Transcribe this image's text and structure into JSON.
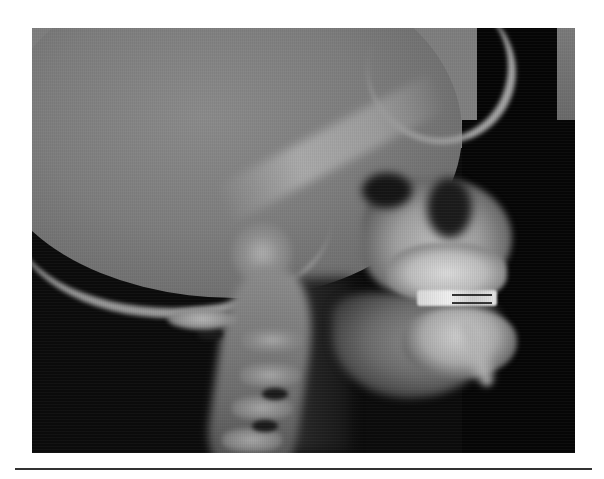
{
  "figure": {
    "type": "radiograph",
    "view": "lateral",
    "features": [
      "cranium",
      "skull-base",
      "maxilla",
      "upper-teeth",
      "orthodontic-appliance",
      "lower-teeth",
      "mandible",
      "cervical-spine"
    ]
  },
  "colors": {
    "background": "#ffffff",
    "film_dark": "#0b0b0b",
    "bone_light": "#bdbdbd",
    "rule": "#333333"
  }
}
